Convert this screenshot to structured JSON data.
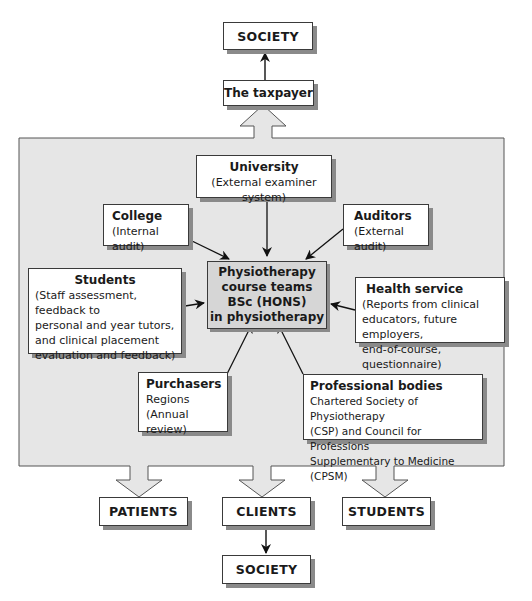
{
  "diagram": {
    "type": "flow",
    "colors": {
      "panel": "#e6e6e6",
      "center_box": "#d6d6d6",
      "border": "#3a3a3a",
      "shadow": "#8a8a8a"
    },
    "top": {
      "society": "SOCIETY",
      "taxpayer": "The taxpayer"
    },
    "center": {
      "lines": [
        "Physiotherapy",
        "course teams",
        "BSc (HONS)",
        "in physiotherapy"
      ]
    },
    "inputs": {
      "university": {
        "title": "University",
        "lines": [
          "(External examiner system)"
        ]
      },
      "college": {
        "title": "College",
        "lines": [
          "(Internal audit)"
        ]
      },
      "auditors": {
        "title": "Auditors",
        "lines": [
          "(External audit)"
        ]
      },
      "students": {
        "title": "Students",
        "lines": [
          "(Staff assessment, feedback to",
          "personal and year tutors,",
          "and clinical placement",
          "evaluation and feedback)"
        ]
      },
      "health_service": {
        "title": "Health service",
        "lines": [
          "(Reports from clinical",
          "educators, future employers,",
          "end-of-course, questionnaire)"
        ]
      },
      "purchasers": {
        "title": "Purchasers",
        "lines": [
          "Regions",
          "(Annual review)"
        ]
      },
      "professional_bodies": {
        "title": "Professional bodies",
        "lines": [
          "Chartered Society of Physiotherapy",
          "(CSP) and Council for Professions",
          "Supplementary to Medicine (CPSM)"
        ]
      }
    },
    "outputs": {
      "patients": "PATIENTS",
      "clients": "CLIENTS",
      "students": "STUDENTS",
      "society": "SOCIETY"
    }
  }
}
